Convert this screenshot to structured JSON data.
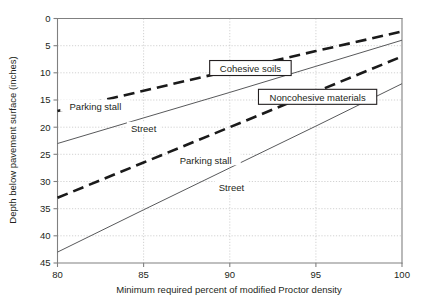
{
  "chart_data": {
    "type": "line",
    "title": "",
    "xlabel": "Minimum required percent of modified Proctor density",
    "ylabel": "Depth below pavement surface (inches)",
    "xlim": [
      80,
      100
    ],
    "ylim": [
      45,
      0
    ],
    "y_inverted": true,
    "grid": true,
    "legend_position": "inline-boxed",
    "xticks": [
      80,
      85,
      90,
      95,
      100
    ],
    "xticklabels": [
      "80",
      "85",
      "90",
      "95",
      "100"
    ],
    "yticks": [
      0,
      5,
      10,
      15,
      20,
      25,
      30,
      35,
      40,
      45
    ],
    "yticklabels": [
      "0",
      "5",
      "10",
      "15",
      "20",
      "25",
      "30",
      "35",
      "40",
      "45"
    ],
    "groups": [
      {
        "name": "Cohesive soils",
        "label_box": true,
        "series": [
          {
            "name": "Parking stall",
            "style": "thick-dashed",
            "x": [
              80,
              85,
              90,
              95,
              100
            ],
            "y": [
              17.0,
              13.3,
              9.6,
              6.0,
              2.4
            ]
          },
          {
            "name": "Street",
            "style": "thin-solid",
            "x": [
              80,
              85,
              90,
              95,
              100
            ],
            "y": [
              23.0,
              18.3,
              13.6,
              8.8,
              4.0
            ]
          }
        ]
      },
      {
        "name": "Noncohesive materials",
        "label_box": true,
        "series": [
          {
            "name": "Parking stall",
            "style": "thick-dashed",
            "x": [
              80,
              85,
              90,
              95,
              100
            ],
            "y": [
              33.0,
              26.5,
              20.0,
              13.5,
              7.0
            ]
          },
          {
            "name": "Street",
            "style": "thin-solid",
            "x": [
              80,
              85,
              90,
              95,
              100
            ],
            "y": [
              43.0,
              35.2,
              27.5,
              19.8,
              12.0
            ]
          }
        ]
      }
    ],
    "annotations": [
      {
        "text": "Parking stall",
        "x": 82.2,
        "y": 16.2
      },
      {
        "text": "Street",
        "x": 85.0,
        "y": 20.3
      },
      {
        "text": "Parking stall",
        "x": 88.6,
        "y": 26.1
      },
      {
        "text": "Street",
        "x": 90.1,
        "y": 31.2
      },
      {
        "text": "Cohesive soils",
        "x": 91.2,
        "y": 9.3,
        "boxed": true
      },
      {
        "text": "Noncohesive materials",
        "x": 95.1,
        "y": 14.6,
        "boxed": true
      }
    ]
  }
}
